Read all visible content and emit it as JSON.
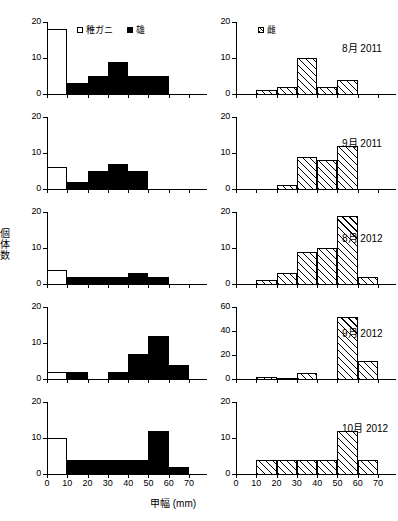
{
  "figure": {
    "xlabel": "甲幅 (mm)",
    "ylabel_chars": [
      "個",
      "体",
      "数"
    ],
    "xticks": [
      "0",
      "10",
      "20",
      "30",
      "40",
      "50",
      "60",
      "70"
    ],
    "legend_left": [
      {
        "key": "juvenile",
        "marker": "open-square",
        "label": "稚ガニ"
      },
      {
        "key": "male",
        "marker": "filled-square",
        "label": "雄"
      }
    ],
    "legend_right": [
      {
        "key": "female",
        "marker": "hatched-square",
        "label": "雌"
      }
    ],
    "colors": {
      "ink": "#000000",
      "paper": "#ffffff"
    },
    "bin_width": 10,
    "xlim": [
      0,
      70
    ]
  },
  "chart_data": {
    "type": "bar",
    "title": "",
    "xlabel": "甲幅 (mm)",
    "ylabel": "個体数",
    "xlim": [
      0,
      70
    ],
    "grid": false,
    "legend_position": "top-inside",
    "categories": [
      "0-10",
      "10-20",
      "20-30",
      "30-40",
      "40-50",
      "50-60",
      "60-70"
    ],
    "panels": [
      {
        "row": 1,
        "column": "left",
        "date": "",
        "ylim": [
          0,
          20
        ],
        "yticks": [
          0,
          10,
          20
        ],
        "series": [
          {
            "name": "稚ガニ",
            "style": "open",
            "values": [
              18,
              0,
              0,
              0,
              0,
              0,
              0
            ]
          },
          {
            "name": "雄",
            "style": "filled",
            "values": [
              0,
              3,
              5,
              9,
              5,
              5,
              0
            ]
          }
        ]
      },
      {
        "row": 1,
        "column": "right",
        "date": "8月 2011",
        "ylim": [
          0,
          20
        ],
        "yticks": [
          0,
          10,
          20
        ],
        "series": [
          {
            "name": "雌",
            "style": "hatched",
            "values": [
              0,
              1,
              2,
              10,
              2,
              4,
              0
            ]
          }
        ]
      },
      {
        "row": 2,
        "column": "left",
        "date": "",
        "ylim": [
          0,
          20
        ],
        "yticks": [
          0,
          10,
          20
        ],
        "series": [
          {
            "name": "稚ガニ",
            "style": "open",
            "values": [
              6,
              0,
              0,
              0,
              0,
              0,
              0
            ]
          },
          {
            "name": "雄",
            "style": "filled",
            "values": [
              0,
              2,
              5,
              7,
              5,
              0,
              0
            ]
          }
        ]
      },
      {
        "row": 2,
        "column": "right",
        "date": "9月 2011",
        "ylim": [
          0,
          20
        ],
        "yticks": [
          0,
          10,
          20
        ],
        "series": [
          {
            "name": "雌",
            "style": "hatched",
            "values": [
              0,
              0,
              1,
              9,
              8,
              12,
              0
            ]
          }
        ]
      },
      {
        "row": 3,
        "column": "left",
        "date": "",
        "ylim": [
          0,
          20
        ],
        "yticks": [
          0,
          10,
          20
        ],
        "series": [
          {
            "name": "稚ガニ",
            "style": "open",
            "values": [
              4,
              0,
              0,
              0,
              0,
              0,
              0
            ]
          },
          {
            "name": "雄",
            "style": "filled",
            "values": [
              0,
              2,
              2,
              2,
              3,
              2,
              0
            ]
          }
        ]
      },
      {
        "row": 3,
        "column": "right",
        "date": "8月 2012",
        "ylim": [
          0,
          20
        ],
        "yticks": [
          0,
          10,
          20
        ],
        "series": [
          {
            "name": "雌",
            "style": "hatched",
            "values": [
              0,
              1,
              3,
              9,
              10,
              19,
              2
            ]
          }
        ]
      },
      {
        "row": 4,
        "column": "left",
        "date": "",
        "ylim": [
          0,
          20
        ],
        "yticks": [
          0,
          10,
          20
        ],
        "series": [
          {
            "name": "稚ガニ",
            "style": "open",
            "values": [
              2,
              0,
              0,
              0,
              0,
              0,
              0
            ]
          },
          {
            "name": "雄",
            "style": "filled",
            "values": [
              0,
              2,
              0,
              2,
              7,
              12,
              4
            ]
          }
        ]
      },
      {
        "row": 4,
        "column": "right",
        "date": "9月 2012",
        "ylim": [
          0,
          60
        ],
        "yticks": [
          0,
          20,
          40,
          60
        ],
        "series": [
          {
            "name": "雌",
            "style": "hatched",
            "values": [
              0,
              2,
              1,
              5,
              0,
              52,
              15
            ]
          }
        ]
      },
      {
        "row": 5,
        "column": "left",
        "date": "",
        "ylim": [
          0,
          20
        ],
        "yticks": [
          0,
          10,
          20
        ],
        "series": [
          {
            "name": "稚ガニ",
            "style": "open",
            "values": [
              10,
              0,
              0,
              0,
              0,
              0,
              0
            ]
          },
          {
            "name": "雄",
            "style": "filled",
            "values": [
              0,
              4,
              4,
              4,
              4,
              12,
              2
            ]
          }
        ]
      },
      {
        "row": 5,
        "column": "right",
        "date": "10月 2012",
        "ylim": [
          0,
          20
        ],
        "yticks": [
          0,
          10,
          20
        ],
        "series": [
          {
            "name": "雌",
            "style": "hatched",
            "values": [
              0,
              4,
              4,
              4,
              4,
              12,
              4
            ]
          }
        ]
      }
    ]
  }
}
